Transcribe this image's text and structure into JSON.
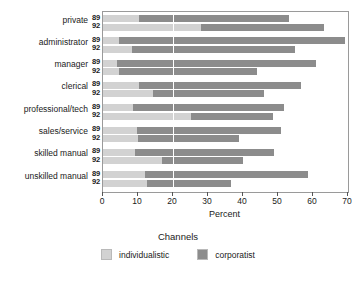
{
  "chart_data": {
    "type": "bar",
    "orientation": "horizontal",
    "stacked": true,
    "title": "",
    "xlabel": "Percent",
    "ylabel": "",
    "xlim": [
      0,
      70
    ],
    "xticks": [
      0,
      10,
      20,
      30,
      40,
      50,
      60,
      70
    ],
    "xticklabels": [
      "0",
      "10",
      "20",
      "30",
      "40",
      "50",
      "60",
      "70"
    ],
    "grid": false,
    "reference_line": 20,
    "legend_title": "Channels",
    "legend_position": "bottom",
    "legend": [
      "individualistic",
      "corporatist"
    ],
    "series_colors": {
      "individualistic": "#d2d2d2",
      "corporatist": "#8c8c8c"
    },
    "categories": [
      "private",
      "administrator",
      "manager",
      "clerical",
      "professional/tech",
      "sales/service",
      "skilled manual",
      "unskilled manual"
    ],
    "year_labels": [
      "89",
      "92"
    ],
    "groups": [
      {
        "category": "private",
        "bars": [
          {
            "year": "89",
            "individualistic": 10.3,
            "corporatist": 42.9,
            "total": 53.2
          },
          {
            "year": "92",
            "individualistic": 28.0,
            "corporatist": 35.1,
            "total": 63.1
          }
        ]
      },
      {
        "category": "administrator",
        "bars": [
          {
            "year": "89",
            "individualistic": 4.6,
            "corporatist": 64.5,
            "total": 69.1
          },
          {
            "year": "92",
            "individualistic": 8.3,
            "corporatist": 46.6,
            "total": 54.9
          }
        ]
      },
      {
        "category": "manager",
        "bars": [
          {
            "year": "89",
            "individualistic": 4.0,
            "corporatist": 56.9,
            "total": 60.9
          },
          {
            "year": "92",
            "individualistic": 4.6,
            "corporatist": 39.4,
            "total": 44.0
          }
        ]
      },
      {
        "category": "clerical",
        "bars": [
          {
            "year": "89",
            "individualistic": 10.3,
            "corporatist": 46.3,
            "total": 56.6
          },
          {
            "year": "92",
            "individualistic": 14.3,
            "corporatist": 31.7,
            "total": 46.0
          }
        ]
      },
      {
        "category": "professional/tech",
        "bars": [
          {
            "year": "89",
            "individualistic": 8.6,
            "corporatist": 43.1,
            "total": 51.7
          },
          {
            "year": "92",
            "individualistic": 25.1,
            "corporatist": 23.4,
            "total": 48.5
          }
        ]
      },
      {
        "category": "sales/service",
        "bars": [
          {
            "year": "89",
            "individualistic": 9.7,
            "corporatist": 41.1,
            "total": 50.8
          },
          {
            "year": "92",
            "individualistic": 10.0,
            "corporatist": 28.9,
            "total": 38.9
          }
        ]
      },
      {
        "category": "skilled manual",
        "bars": [
          {
            "year": "89",
            "individualistic": 9.1,
            "corporatist": 39.7,
            "total": 48.8
          },
          {
            "year": "92",
            "individualistic": 16.9,
            "corporatist": 23.1,
            "total": 40.0
          }
        ]
      },
      {
        "category": "unskilled manual",
        "bars": [
          {
            "year": "89",
            "individualistic": 12.0,
            "corporatist": 46.6,
            "total": 58.6
          },
          {
            "year": "92",
            "individualistic": 12.6,
            "corporatist": 23.9,
            "total": 36.5
          }
        ]
      }
    ]
  }
}
